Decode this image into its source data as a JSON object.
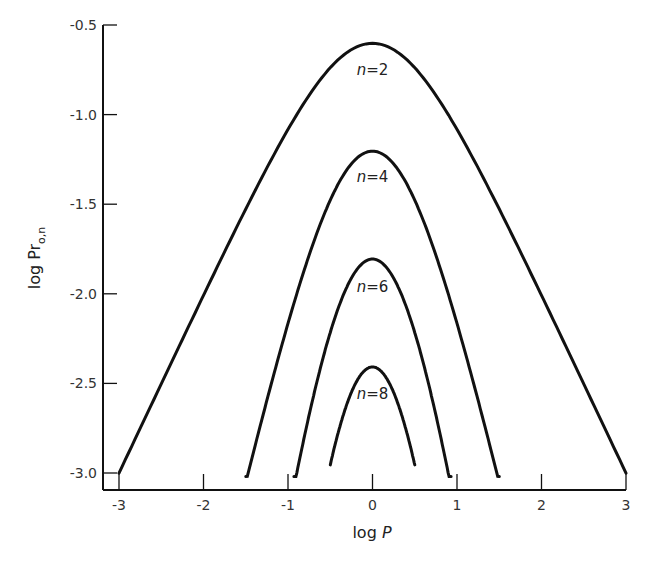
{
  "chart_data": {
    "type": "line",
    "title": "",
    "xlabel": "log P",
    "ylabel": "log Pr0,n",
    "ylabel_main": "log Pr",
    "ylabel_sub": "o,n",
    "xlim": [
      -3,
      3
    ],
    "ylim": [
      -3.0,
      -0.5
    ],
    "x_ticks": [
      -3,
      -2,
      -1,
      0,
      1,
      2,
      3
    ],
    "x_tick_labels": [
      "-3",
      "-2",
      "-1",
      "0",
      "1",
      "2",
      "3"
    ],
    "y_ticks": [
      -0.5,
      -1.0,
      -1.5,
      -2.0,
      -2.5,
      -3.0
    ],
    "y_tick_labels": [
      "-0.5",
      "-1.0",
      "-1.5",
      "-2.0",
      "-2.5",
      "-3.0"
    ],
    "grid": false,
    "legend": "inline labels",
    "formula": "log Pr = (n/2) * (logP - 2*log10(1 + 10^logP))",
    "series": [
      {
        "name": "n=2",
        "n": 2,
        "label_italic": "n",
        "label_rest": "=2",
        "peak": {
          "x": 0,
          "y": -0.6
        },
        "x_range": [
          -3.0,
          3.0
        ],
        "x": [
          -3,
          -2,
          -1,
          0,
          1,
          2,
          3
        ],
        "values": [
          -3.0,
          -2.01,
          -1.08,
          -0.6,
          -1.08,
          -2.01,
          -3.0
        ]
      },
      {
        "name": "n=4",
        "n": 4,
        "label_italic": "n",
        "label_rest": "=4",
        "peak": {
          "x": 0,
          "y": -1.2
        },
        "x_range": [
          -1.5,
          1.5
        ],
        "x": [
          -1.5,
          -1,
          0,
          1,
          1.5
        ],
        "values": [
          -3.05,
          -2.17,
          -1.2,
          -2.17,
          -3.05
        ]
      },
      {
        "name": "n=6",
        "n": 6,
        "label_italic": "n",
        "label_rest": "=6",
        "peak": {
          "x": 0,
          "y": -1.81
        },
        "x_range": [
          -0.93,
          0.93
        ],
        "x": [
          -0.93,
          -0.5,
          0,
          0.5,
          0.93
        ],
        "values": [
          -3.0,
          -2.17,
          -1.81,
          -2.17,
          -3.0
        ]
      },
      {
        "name": "n=8",
        "n": 8,
        "label_italic": "n",
        "label_rest": "=8",
        "peak": {
          "x": 0,
          "y": -2.41
        },
        "x_range": [
          -0.5,
          0.5
        ],
        "x": [
          -0.5,
          -0.25,
          0,
          0.25,
          0.5
        ],
        "values": [
          -2.89,
          -2.53,
          -2.41,
          -2.53,
          -2.89
        ]
      }
    ]
  },
  "layout": {
    "x0_px": 119,
    "x1_px": 626,
    "y_top_val": -0.5,
    "y_top_px": 25,
    "y_bot_val": -3.0,
    "y_bot_px": 473,
    "axis_left_px": 103,
    "axis_bottom_px": 490,
    "line_color": "#111111"
  }
}
